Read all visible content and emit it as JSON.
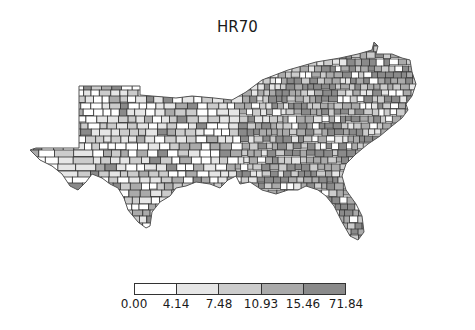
{
  "title": "HR70",
  "chart_data": {
    "type": "choropleth",
    "title": "HR70",
    "region": "Southern United States counties",
    "classification": "quantiles",
    "bins": [
      {
        "lower": 0.0,
        "upper": 4.14,
        "color": "#ffffff"
      },
      {
        "lower": 4.14,
        "upper": 7.48,
        "color": "#e6e6e6"
      },
      {
        "lower": 7.48,
        "upper": 10.93,
        "color": "#cccccc"
      },
      {
        "lower": 10.93,
        "upper": 15.46,
        "color": "#aaaaaa"
      },
      {
        "lower": 15.46,
        "upper": 71.84,
        "color": "#8a8a8a"
      }
    ],
    "legend": {
      "position": "bottom",
      "tick_labels": [
        "0.00",
        "4.14",
        "7.48",
        "10.93",
        "15.46",
        "71.84"
      ]
    },
    "edge_color": "#333333"
  },
  "legend": {
    "ticks": [
      "0.00",
      "4.14",
      "7.48",
      "10.93",
      "15.46",
      "71.84"
    ]
  }
}
